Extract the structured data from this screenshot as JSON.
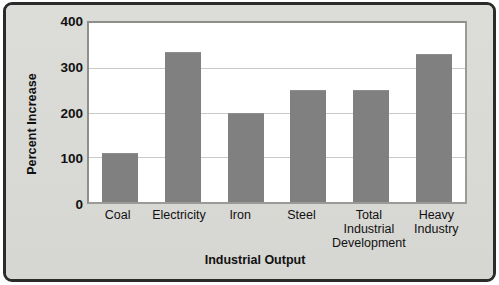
{
  "chart_data": {
    "type": "bar",
    "title": "",
    "xlabel": "Industrial Output",
    "ylabel": "Percent Increase",
    "categories": [
      "Coal",
      "Electricity",
      "Iron",
      "Steel",
      "Total Industrial Development",
      "Heavy Industry"
    ],
    "category_lines": [
      [
        "Coal"
      ],
      [
        "Electricity"
      ],
      [
        "Iron"
      ],
      [
        "Steel"
      ],
      [
        "Total",
        "Industrial",
        "Development"
      ],
      [
        "Heavy",
        "Industry"
      ]
    ],
    "values": [
      110,
      335,
      200,
      250,
      250,
      330
    ],
    "ylim": [
      0,
      400
    ],
    "yticks": [
      0,
      100,
      200,
      300,
      400
    ],
    "ytick_labels": [
      "0",
      "100",
      "200",
      "300",
      "400"
    ],
    "grid": true,
    "legend": "none",
    "colors": {
      "bar": "#808080",
      "plot_background": "#ffffff",
      "panel_background": "#d9d9d5",
      "frame_border": "#2b2b2b",
      "gridline": "#c9c9c5",
      "text": "#111111"
    }
  }
}
